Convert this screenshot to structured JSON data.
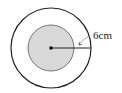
{
  "diagram": {
    "type": "concentric-circles",
    "outer_circle": {
      "fill": "#ffffff",
      "stroke": "#222222"
    },
    "inner_circle": {
      "fill": "#d9d9d9",
      "stroke": "#555555"
    },
    "center_point": {
      "color": "#111111"
    },
    "annotation": {
      "label": "6cm",
      "refers_to": "ring width between inner and outer circle"
    }
  }
}
